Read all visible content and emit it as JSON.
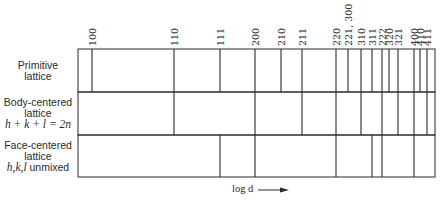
{
  "chart_data": {
    "type": "diagram",
    "title": "",
    "xlabel": "log d",
    "x_axis_direction": "increasing to the right (arrow)",
    "reflections": [
      {
        "hkl": "100",
        "x": 92
      },
      {
        "hkl": "110",
        "x": 174
      },
      {
        "hkl": "111",
        "x": 220
      },
      {
        "hkl": "200",
        "x": 255
      },
      {
        "hkl": "210",
        "x": 281
      },
      {
        "hkl": "211",
        "x": 302
      },
      {
        "hkl": "220",
        "x": 336
      },
      {
        "hkl": "221, 300",
        "x": 348
      },
      {
        "hkl": "310",
        "x": 361
      },
      {
        "hkl": "311",
        "x": 372
      },
      {
        "hkl": "222",
        "x": 382
      },
      {
        "hkl": "320",
        "x": 389
      },
      {
        "hkl": "321",
        "x": 398
      },
      {
        "hkl": "400",
        "x": 414
      },
      {
        "hkl": "410",
        "x": 420
      },
      {
        "hkl": "411",
        "x": 427
      }
    ],
    "rows": [
      {
        "label_lines": [
          "Primitive",
          "lattice"
        ],
        "condition": "",
        "allowed": [
          "100",
          "110",
          "111",
          "200",
          "210",
          "211",
          "220",
          "221, 300",
          "310",
          "311",
          "222",
          "320",
          "321",
          "400",
          "410",
          "411"
        ]
      },
      {
        "label_lines": [
          "Body-centered",
          "lattice"
        ],
        "condition": "h + k + l = 2n",
        "allowed": [
          "110",
          "200",
          "211",
          "220",
          "310",
          "222",
          "321",
          "400",
          "411"
        ]
      },
      {
        "label_lines": [
          "Face-centered",
          "lattice"
        ],
        "condition": "h,k,l unmixed",
        "allowed": [
          "111",
          "200",
          "220",
          "311",
          "222",
          "400"
        ]
      }
    ]
  },
  "labels": {
    "row1_line1": "Primitive",
    "row1_line2": "lattice",
    "row2_line1": "Body-centered",
    "row2_line2": "lattice",
    "row2_line3": "h + k + l = 2n",
    "row3_line1": "Face-centered",
    "row3_line2": "lattice",
    "row3_line3_math": "h,k,l",
    "row3_line3_text": " unmixed",
    "xlabel": "log d"
  },
  "colors": {
    "line": "#2a2a2a",
    "background": "#ffffff"
  }
}
